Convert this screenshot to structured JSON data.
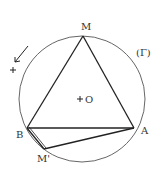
{
  "figure": {
    "circle": {
      "name": "(Γ)",
      "label": "(Γ)",
      "center_label": "O"
    },
    "points": {
      "M": {
        "label": "M"
      },
      "A": {
        "label": "A"
      },
      "B": {
        "label": "B"
      },
      "M_prime": {
        "label": "M'"
      }
    },
    "orientation": {
      "sign": "+"
    },
    "colors": {
      "stroke": "#222222",
      "circle_stroke": "#555555",
      "text": "#333333"
    }
  }
}
